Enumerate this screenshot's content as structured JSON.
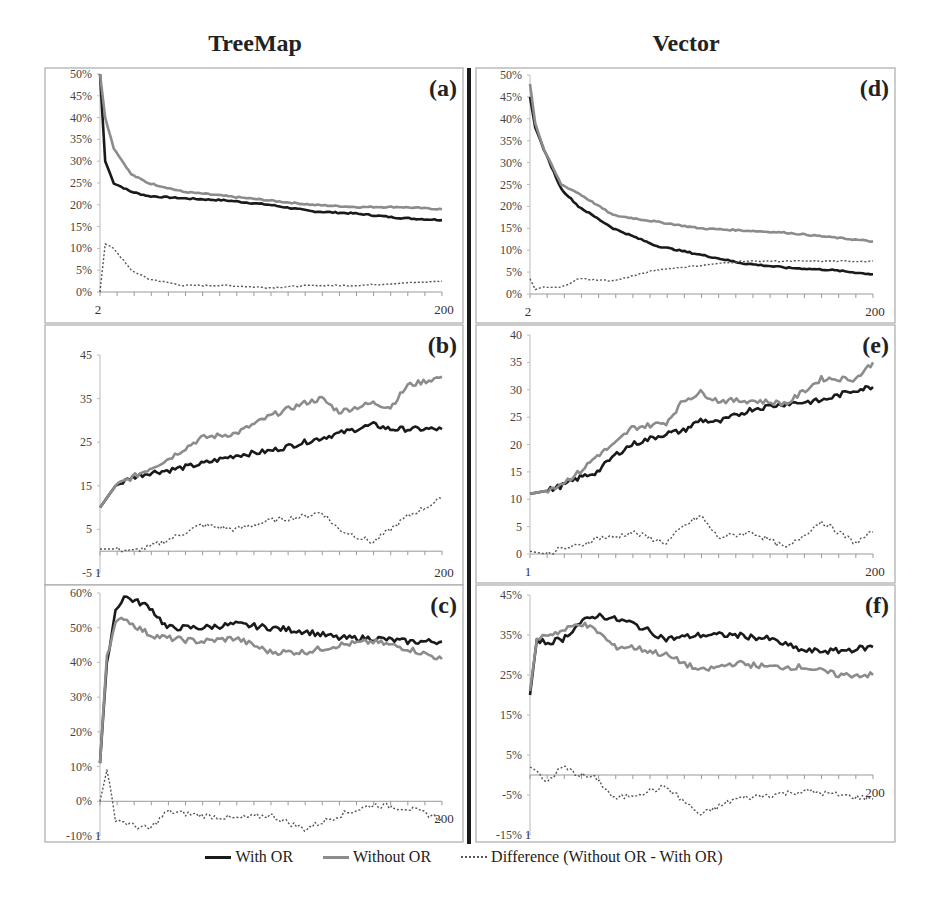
{
  "columns": [
    {
      "title": "TreeMap"
    },
    {
      "title": "Vector"
    }
  ],
  "legend": [
    {
      "label": "With OR",
      "color": "#1a1a1a",
      "style": "solid"
    },
    {
      "label": "Without OR",
      "color": "#8c8c8c",
      "style": "solid"
    },
    {
      "label": "Difference (Without OR - With OR)",
      "color": "#555555",
      "style": "dotted"
    }
  ],
  "chart_data": [
    {
      "id": "a",
      "panel_label": "(a)",
      "column": "TreeMap",
      "type": "line",
      "x_start": 2,
      "x_end": 200,
      "x_ticks": [
        "2",
        "200"
      ],
      "ylim": [
        0,
        50
      ],
      "y_ticks": [
        "0%",
        "5%",
        "10%",
        "15%",
        "20%",
        "25%",
        "30%",
        "35%",
        "40%",
        "45%",
        "50%"
      ],
      "y_percent": true,
      "x": [
        2,
        5,
        10,
        20,
        30,
        50,
        75,
        100,
        125,
        150,
        175,
        200
      ],
      "series": [
        {
          "name": "With OR",
          "values": [
            50,
            30,
            25,
            23,
            22,
            21.5,
            21,
            20,
            18.5,
            18,
            17,
            16.5
          ]
        },
        {
          "name": "Without OR",
          "values": [
            50,
            40,
            33,
            27,
            25,
            23,
            22,
            21,
            20,
            19.5,
            19.5,
            19
          ]
        },
        {
          "name": "Difference (Without OR - With OR)",
          "values": [
            0,
            11,
            10,
            5,
            3,
            1.5,
            1.5,
            1,
            1.5,
            1.5,
            2,
            2.5
          ]
        }
      ]
    },
    {
      "id": "b",
      "panel_label": "(b)",
      "column": "TreeMap",
      "type": "line",
      "x_start": 1,
      "x_end": 200,
      "x_ticks": [
        "1",
        "200"
      ],
      "ylim": [
        -5,
        45
      ],
      "y_ticks": [
        "-5",
        "5",
        "15",
        "25",
        "35",
        "45"
      ],
      "y_percent": false,
      "x": [
        1,
        10,
        20,
        30,
        40,
        60,
        80,
        100,
        120,
        130,
        140,
        160,
        170,
        180,
        200
      ],
      "series": [
        {
          "name": "With OR",
          "values": [
            10,
            15,
            17,
            18,
            18.5,
            20,
            22,
            23,
            25,
            26,
            27,
            29,
            28,
            28,
            28
          ]
        },
        {
          "name": "Without OR",
          "values": [
            10,
            15,
            17,
            19,
            21,
            26,
            27,
            31,
            34,
            35,
            32,
            34,
            33,
            38,
            40
          ]
        },
        {
          "name": "Difference (Without OR - With OR)",
          "values": [
            0.5,
            0.5,
            0,
            1,
            2.5,
            6,
            5,
            7,
            8,
            9,
            5,
            2,
            5,
            8,
            12
          ]
        }
      ]
    },
    {
      "id": "c",
      "panel_label": "(c)",
      "column": "TreeMap",
      "type": "line",
      "x_start": 1,
      "x_end": 200,
      "x_ticks": [
        "1",
        "200"
      ],
      "ylim": [
        -10,
        60
      ],
      "y_ticks": [
        "-10%",
        "0%",
        "10%",
        "20%",
        "30%",
        "40%",
        "50%",
        "60%"
      ],
      "y_percent": true,
      "x": [
        1,
        5,
        10,
        15,
        20,
        30,
        40,
        60,
        80,
        100,
        120,
        140,
        160,
        180,
        200
      ],
      "series": [
        {
          "name": "With OR",
          "values": [
            11,
            40,
            55,
            59,
            58,
            56,
            50,
            50,
            51,
            50,
            49,
            47,
            47,
            46,
            46
          ]
        },
        {
          "name": "Without OR",
          "values": [
            11,
            42,
            51,
            53,
            51,
            48,
            47,
            46,
            47,
            43,
            43,
            45,
            46,
            44,
            41
          ]
        },
        {
          "name": "Difference (Without OR - With OR)",
          "values": [
            0,
            9,
            -5,
            -6,
            -7,
            -8,
            -3,
            -4,
            -5,
            -4,
            -8,
            -4,
            -1,
            -2,
            -5
          ]
        }
      ]
    },
    {
      "id": "d",
      "panel_label": "(d)",
      "column": "Vector",
      "type": "line",
      "x_start": 2,
      "x_end": 200,
      "x_ticks": [
        "2",
        "200"
      ],
      "ylim": [
        0,
        50
      ],
      "y_ticks": [
        "0%",
        "5%",
        "10%",
        "15%",
        "20%",
        "25%",
        "30%",
        "35%",
        "40%",
        "45%",
        "50%"
      ],
      "y_percent": true,
      "x": [
        2,
        5,
        10,
        20,
        30,
        50,
        75,
        100,
        125,
        150,
        175,
        200
      ],
      "series": [
        {
          "name": "With OR",
          "values": [
            45,
            38,
            33,
            24,
            20,
            15,
            11,
            9,
            7,
            6,
            5.5,
            4.5
          ]
        },
        {
          "name": "Without OR",
          "values": [
            48,
            39,
            33,
            25,
            23,
            18,
            16.5,
            15,
            14.5,
            14,
            13,
            12
          ]
        },
        {
          "name": "Difference (Without OR - With OR)",
          "values": [
            3.5,
            1,
            1.5,
            1.5,
            3.5,
            3,
            5.5,
            6.5,
            7.5,
            7.5,
            7.5,
            7.5
          ]
        }
      ]
    },
    {
      "id": "e",
      "panel_label": "(e)",
      "column": "Vector",
      "type": "line",
      "x_start": 1,
      "x_end": 200,
      "x_ticks": [
        "1",
        "200"
      ],
      "ylim": [
        0,
        40
      ],
      "y_ticks": [
        "0",
        "5",
        "10",
        "15",
        "20",
        "25",
        "30",
        "35",
        "40"
      ],
      "y_percent": false,
      "x": [
        1,
        10,
        20,
        30,
        40,
        50,
        60,
        80,
        90,
        100,
        110,
        130,
        150,
        170,
        190,
        200
      ],
      "series": [
        {
          "name": "With OR",
          "values": [
            11,
            11.5,
            12.5,
            14,
            15,
            18,
            20,
            22,
            22.5,
            24.5,
            24,
            26.5,
            27.5,
            28,
            30,
            30.5
          ]
        },
        {
          "name": "Without OR",
          "values": [
            11,
            11.5,
            13,
            15,
            18,
            20,
            23,
            24,
            28,
            29.5,
            28,
            28,
            27.5,
            32,
            32,
            35
          ]
        },
        {
          "name": "Difference (Without OR - With OR)",
          "values": [
            0.5,
            0,
            1,
            1.5,
            3,
            3,
            4,
            2,
            5,
            7,
            3,
            4,
            1,
            6,
            2,
            4
          ]
        }
      ]
    },
    {
      "id": "f",
      "panel_label": "(f)",
      "column": "Vector",
      "type": "line",
      "x_start": 1,
      "x_end": 200,
      "x_ticks": [
        "1",
        "200"
      ],
      "ylim": [
        -15,
        45
      ],
      "y_ticks": [
        "-15%",
        "-5%",
        "5%",
        "15%",
        "25%",
        "35%",
        "45%"
      ],
      "y_percent": true,
      "x": [
        1,
        5,
        10,
        20,
        30,
        40,
        50,
        60,
        80,
        100,
        120,
        140,
        160,
        180,
        200
      ],
      "series": [
        {
          "name": "With OR",
          "values": [
            20,
            34,
            33,
            34,
            38,
            40,
            39,
            38,
            34,
            35,
            35,
            34,
            31,
            31,
            32
          ]
        },
        {
          "name": "Without OR",
          "values": [
            21,
            34,
            35,
            36,
            38,
            36,
            32,
            32,
            30,
            26,
            28,
            27,
            27,
            25,
            25
          ]
        },
        {
          "name": "Difference (Without OR - With OR)",
          "values": [
            2,
            1,
            -2,
            2,
            0,
            -1,
            -6,
            -5,
            -3,
            -10,
            -6,
            -5,
            -4,
            -5,
            -6
          ]
        }
      ]
    }
  ]
}
